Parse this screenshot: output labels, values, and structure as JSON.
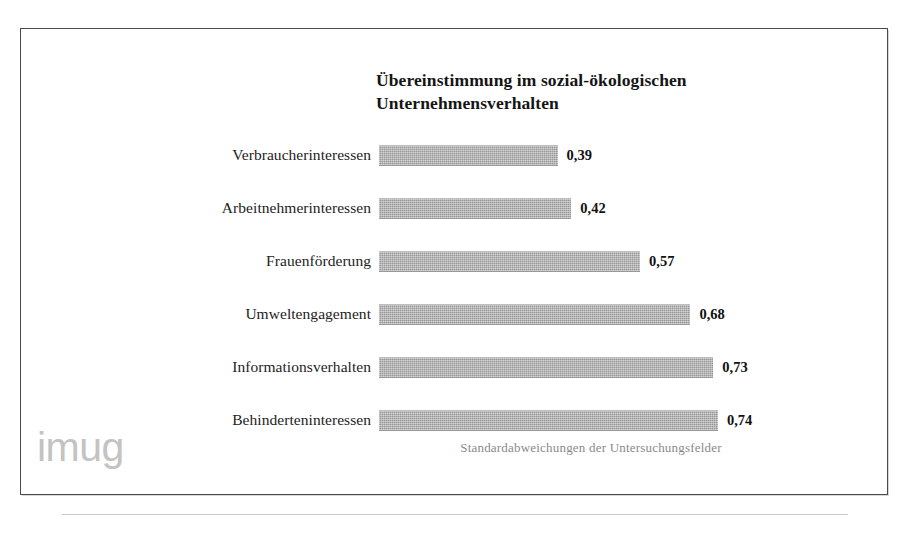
{
  "figure": {
    "title_lines": [
      "Übereinstimmung im sozial-ökologischen",
      "Unternehmensverhalten"
    ],
    "caption": "Standardabweichungen der Untersuchungsfelder",
    "logo_text": "imug",
    "footnote": "",
    "bar_color": "#a9a9a9",
    "frame_color": "#4a4a4a",
    "caption_color": "#8a8a8a",
    "logo_color": "#c3c3c3"
  },
  "chart_data": {
    "type": "bar",
    "orientation": "horizontal",
    "title": "Übereinstimmung im sozial-ökologischen Unternehmensverhalten",
    "subtitle": "Standardabweichungen der Untersuchungsfelder",
    "xlabel": "",
    "ylabel": "",
    "xlim": [
      0,
      0.8
    ],
    "grid": false,
    "legend": false,
    "value_format": "german-decimal-comma",
    "categories": [
      "Verbraucherinteressen",
      "Arbeitnehmerinteressen",
      "Frauenförderung",
      "Umweltengagement",
      "Informationsverhalten",
      "Behinderteninteressen"
    ],
    "values": [
      0.39,
      0.42,
      0.57,
      0.68,
      0.73,
      0.74
    ],
    "value_labels": [
      "0,39",
      "0,42",
      "0,57",
      "0,68",
      "0,73",
      "0,74"
    ],
    "bars": [
      {
        "category": "Verbraucherinteressen",
        "value": 0.39,
        "label": "0,39"
      },
      {
        "category": "Arbeitnehmerinteressen",
        "value": 0.42,
        "label": "0,42"
      },
      {
        "category": "Frauenförderung",
        "value": 0.57,
        "label": "0,57"
      },
      {
        "category": "Umweltengagement",
        "value": 0.68,
        "label": "0,68"
      },
      {
        "category": "Informationsverhalten",
        "value": 0.73,
        "label": "0,73"
      },
      {
        "category": "Behinderteninteressen",
        "value": 0.74,
        "label": "0,74"
      }
    ]
  }
}
